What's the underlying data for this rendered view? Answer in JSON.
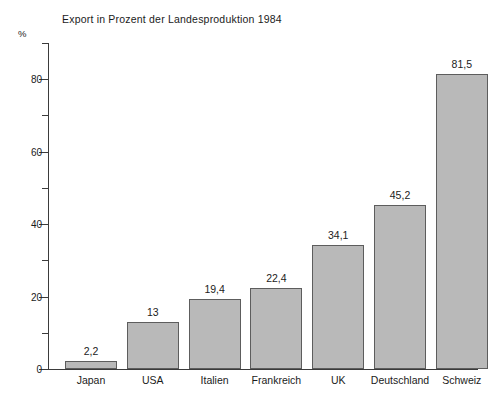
{
  "chart_data": {
    "type": "bar",
    "title": "Export in Prozent der Landesproduktion 1984",
    "xlabel": "",
    "ylabel": "%",
    "ylim": [
      0,
      90
    ],
    "grid": false,
    "legend": false,
    "y_major_ticks": [
      "0",
      "20",
      "40",
      "60",
      "80"
    ],
    "y_major_tick_values": [
      0,
      20,
      40,
      60,
      80
    ],
    "y_minor_tick_values": [
      10,
      30,
      50,
      70,
      90
    ],
    "categories": [
      "Japan",
      "USA",
      "Italien",
      "Frankreich",
      "UK",
      "Deutschland",
      "Schweiz"
    ],
    "values": [
      2.2,
      13,
      19.4,
      22.4,
      34.1,
      45.2,
      81.5
    ],
    "value_labels": [
      "2,2",
      "13",
      "19,4",
      "22,4",
      "34,1",
      "45,2",
      "81,5"
    ],
    "bar_color": "#b9b9b9",
    "bar_border_color": "#5d5d5d",
    "axis_color": "#3b3b3b",
    "text_color": "#1b1b1b",
    "background_color": "#ffffff"
  },
  "unit": {
    "label": "%"
  }
}
